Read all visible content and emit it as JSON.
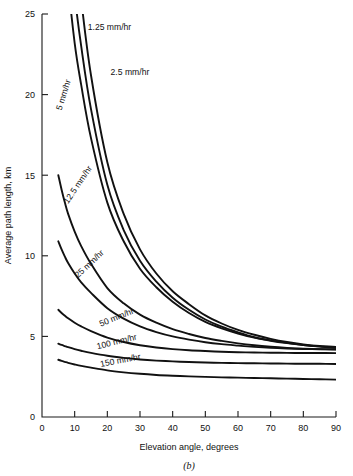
{
  "figure": {
    "caption": "(b)",
    "xlabel": "Elevation angle, degrees",
    "ylabel": "Average path length, km"
  },
  "axes": {
    "x_ticks": [
      "0",
      "10",
      "20",
      "30",
      "40",
      "50",
      "60",
      "70",
      "80",
      "90"
    ],
    "y_ticks": [
      "0",
      "5",
      "10",
      "15",
      "20",
      "25"
    ]
  },
  "chart_data": {
    "type": "line",
    "title": "",
    "xlabel": "Elevation angle, degrees",
    "ylabel": "Average path length, km",
    "xlim": [
      0,
      90
    ],
    "ylim": [
      0,
      25
    ],
    "grid": false,
    "legend": "inline-curve-labels",
    "x": [
      5,
      6,
      7,
      8,
      10,
      12,
      15,
      20,
      25,
      30,
      35,
      40,
      45,
      50,
      55,
      60,
      65,
      70,
      75,
      80,
      85,
      90
    ],
    "series": [
      {
        "name": "1.25 mm/hr",
        "label": "1.25 mm/hr",
        "values": [
          null,
          null,
          null,
          null,
          29.8,
          25.9,
          21.2,
          15.8,
          12.6,
          10.4,
          8.9,
          7.8,
          7.0,
          6.3,
          5.8,
          5.4,
          5.1,
          4.85,
          4.65,
          4.5,
          4.4,
          4.35
        ]
      },
      {
        "name": "2.5 mm/hr",
        "label": "2.5 mm/hr",
        "values": [
          null,
          null,
          null,
          30.6,
          26.2,
          23.0,
          19.1,
          14.4,
          11.6,
          9.7,
          8.4,
          7.4,
          6.65,
          6.05,
          5.6,
          5.25,
          4.95,
          4.75,
          4.6,
          4.47,
          4.38,
          4.32
        ]
      },
      {
        "name": "5 mm/hr",
        "label": "5 mm/hr",
        "values": [
          null,
          null,
          29.8,
          27.0,
          23.2,
          20.6,
          17.3,
          13.3,
          10.9,
          9.2,
          8.05,
          7.15,
          6.45,
          5.9,
          5.5,
          5.18,
          4.92,
          4.73,
          4.58,
          4.46,
          4.37,
          4.3
        ]
      },
      {
        "name": "12.5 mm/hr",
        "label": "12.5 mm/hr",
        "values": [
          15.0,
          14.1,
          13.3,
          12.6,
          11.5,
          10.6,
          9.5,
          8.0,
          7.05,
          6.35,
          5.85,
          5.45,
          5.15,
          4.9,
          4.72,
          4.57,
          4.45,
          4.36,
          4.29,
          4.24,
          4.21,
          4.2
        ]
      },
      {
        "name": "25 mm/hr",
        "label": "25 mm/hr",
        "values": [
          10.9,
          10.4,
          9.95,
          9.55,
          8.9,
          8.35,
          7.7,
          6.75,
          6.1,
          5.62,
          5.27,
          5.0,
          4.8,
          4.64,
          4.52,
          4.43,
          4.35,
          4.29,
          4.25,
          4.22,
          4.2,
          4.19
        ]
      },
      {
        "name": "50 mm/hr",
        "label": "50 mm/hr",
        "values": [
          6.65,
          6.45,
          6.28,
          6.12,
          5.85,
          5.62,
          5.33,
          4.93,
          4.65,
          4.45,
          4.31,
          4.21,
          4.14,
          4.09,
          4.05,
          4.02,
          4.0,
          3.99,
          3.98,
          3.97,
          3.97,
          3.96
        ]
      },
      {
        "name": "100 mm/hr",
        "label": "100 mm/hr",
        "values": [
          4.55,
          4.47,
          4.4,
          4.33,
          4.21,
          4.11,
          3.98,
          3.8,
          3.67,
          3.57,
          3.5,
          3.45,
          3.41,
          3.38,
          3.36,
          3.34,
          3.33,
          3.32,
          3.31,
          3.3,
          3.3,
          3.29
        ]
      },
      {
        "name": "150 mm/hr",
        "label": "150 mm/hr",
        "values": [
          3.55,
          3.48,
          3.42,
          3.36,
          3.26,
          3.17,
          3.06,
          2.89,
          2.77,
          2.68,
          2.61,
          2.56,
          2.52,
          2.49,
          2.46,
          2.44,
          2.42,
          2.4,
          2.38,
          2.36,
          2.34,
          2.32
        ]
      }
    ],
    "annotations": [
      {
        "text": "1.25 mm/hr",
        "x": 14,
        "y": 24.0,
        "rotation": 0
      },
      {
        "text": "2.5 mm/hr",
        "x": 21,
        "y": 21.2,
        "rotation": 0
      },
      {
        "text": "5 mm/hr",
        "x": 6,
        "y": 19.0,
        "rotation": -73
      },
      {
        "text": "12.5 mm/hr",
        "x": 8,
        "y": 13.2,
        "rotation": -56
      },
      {
        "text": "25 mm/hr",
        "x": 11,
        "y": 8.6,
        "rotation": -43
      },
      {
        "text": "50 mm/hr",
        "x": 18,
        "y": 5.6,
        "rotation": -22
      },
      {
        "text": "100 mm/hr",
        "x": 17,
        "y": 4.2,
        "rotation": -14
      },
      {
        "text": "150 mm/hr",
        "x": 18,
        "y": 3.1,
        "rotation": -11
      }
    ]
  }
}
